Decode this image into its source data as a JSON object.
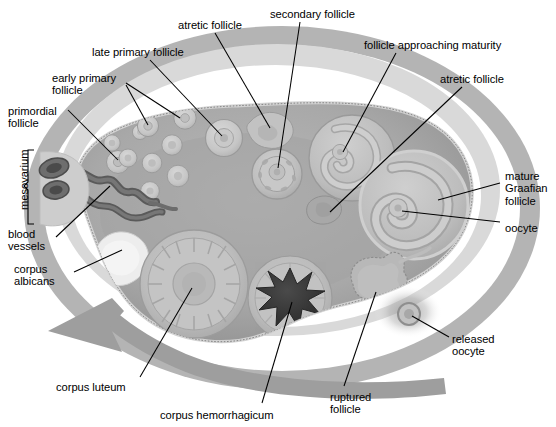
{
  "diagram": {
    "type": "anatomical-illustration",
    "colors": {
      "background": "#ffffff",
      "outer_ring": "#b4b4b4",
      "inner_halo": "#d9d9d9",
      "cortex": "#9a9a9a",
      "medulla": "#a8a8a8",
      "stroma": "#b5b5b5",
      "follicle_fill": "#c4c4c4",
      "follicle_light": "#d2d2d2",
      "antrum": "#bdbdbd",
      "corpus_albicans": "#ececec",
      "corpus_hemorrhagicum": "#3a3a3a",
      "blood_vessels": "#5a5a5a",
      "epithelium": "#cccccc",
      "arrow": "#9e9e9e",
      "leader_line": "#000000",
      "text": "#000000"
    }
  },
  "labels": [
    {
      "id": "primordial-follicle",
      "text": "primordial\nfollicle",
      "x": 8,
      "y": 105,
      "align": "left"
    },
    {
      "id": "early-primary-follicle",
      "text": "early primary\nfollicle",
      "x": 52,
      "y": 72,
      "align": "left"
    },
    {
      "id": "late-primary-follicle",
      "text": "late primary follicle",
      "x": 92,
      "y": 46,
      "align": "left"
    },
    {
      "id": "atretic-follicle-top",
      "text": "atretic follicle",
      "x": 178,
      "y": 19,
      "align": "left"
    },
    {
      "id": "secondary-follicle",
      "text": "secondary follicle",
      "x": 270,
      "y": 8,
      "align": "left"
    },
    {
      "id": "follicle-approaching-maturity",
      "text": "follicle approaching maturity",
      "x": 364,
      "y": 39,
      "align": "left"
    },
    {
      "id": "atretic-follicle-right",
      "text": "atretic follicle",
      "x": 440,
      "y": 73,
      "align": "left"
    },
    {
      "id": "mature-graafian-follicle",
      "text": "mature\nGraafian\nfollicle",
      "x": 505,
      "y": 170,
      "align": "left"
    },
    {
      "id": "oocyte",
      "text": "oocyte",
      "x": 505,
      "y": 222,
      "align": "left"
    },
    {
      "id": "released-oocyte",
      "text": "released\noocyte",
      "x": 452,
      "y": 333,
      "align": "left"
    },
    {
      "id": "ruptured-follicle",
      "text": "ruptured\nfollicle",
      "x": 330,
      "y": 391,
      "align": "left"
    },
    {
      "id": "corpus-hemorrhagicum",
      "text": "corpus hemorrhagicum",
      "x": 160,
      "y": 409,
      "align": "left"
    },
    {
      "id": "corpus-luteum",
      "text": "corpus luteum",
      "x": 56,
      "y": 381,
      "align": "left"
    },
    {
      "id": "corpus-albicans",
      "text": "corpus\nalbicans",
      "x": 14,
      "y": 263,
      "align": "left"
    },
    {
      "id": "blood-vessels",
      "text": "blood\nvessels",
      "x": 8,
      "y": 228,
      "align": "left"
    },
    {
      "id": "mesovarium",
      "text": "mesovarium",
      "x": 18,
      "y": 210,
      "align": "rotated"
    }
  ],
  "structures": [
    {
      "id": "primordial-follicle",
      "name": "primordial follicle"
    },
    {
      "id": "early-primary-follicle",
      "name": "early primary follicle"
    },
    {
      "id": "late-primary-follicle",
      "name": "late primary follicle"
    },
    {
      "id": "secondary-follicle",
      "name": "secondary follicle"
    },
    {
      "id": "atretic-follicle",
      "name": "atretic follicle"
    },
    {
      "id": "follicle-approaching-maturity",
      "name": "follicle approaching maturity"
    },
    {
      "id": "mature-graafian-follicle",
      "name": "mature Graafian follicle"
    },
    {
      "id": "oocyte",
      "name": "oocyte"
    },
    {
      "id": "released-oocyte",
      "name": "released oocyte"
    },
    {
      "id": "ruptured-follicle",
      "name": "ruptured follicle"
    },
    {
      "id": "corpus-hemorrhagicum",
      "name": "corpus hemorrhagicum"
    },
    {
      "id": "corpus-luteum",
      "name": "corpus luteum"
    },
    {
      "id": "corpus-albicans",
      "name": "corpus albicans"
    },
    {
      "id": "blood-vessels",
      "name": "blood vessels"
    },
    {
      "id": "mesovarium",
      "name": "mesovarium"
    }
  ]
}
